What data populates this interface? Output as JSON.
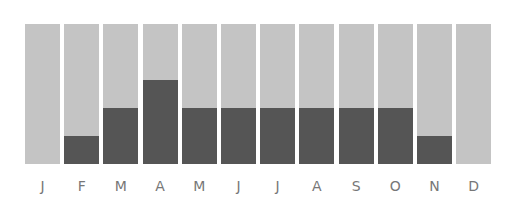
{
  "chart_data": {
    "type": "bar",
    "title": "",
    "xlabel": "",
    "ylabel": "",
    "categories": [
      "J",
      "F",
      "M",
      "A",
      "M",
      "J",
      "J",
      "A",
      "S",
      "O",
      "N",
      "D"
    ],
    "values": [
      0,
      1,
      2,
      3,
      2,
      2,
      2,
      2,
      2,
      2,
      1,
      0
    ],
    "ylim": [
      0,
      5
    ],
    "grid": false,
    "legend": null,
    "colors": {
      "background_bar": "#c4c4c4",
      "value_bar": "#555555",
      "label": "#777777"
    }
  }
}
